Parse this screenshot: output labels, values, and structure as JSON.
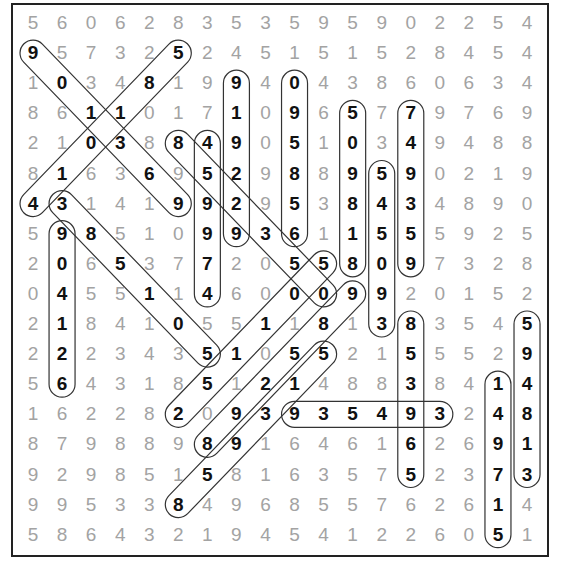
{
  "puzzle": {
    "type": "number-search",
    "rows": 18,
    "cols": 18,
    "grid": [
      [
        5,
        6,
        0,
        6,
        2,
        8,
        3,
        5,
        3,
        5,
        9,
        5,
        9,
        0,
        2,
        2,
        5,
        4
      ],
      [
        9,
        5,
        7,
        3,
        2,
        5,
        2,
        4,
        5,
        1,
        5,
        1,
        5,
        2,
        8,
        4,
        5,
        4
      ],
      [
        1,
        0,
        3,
        4,
        8,
        1,
        9,
        9,
        4,
        0,
        4,
        3,
        8,
        6,
        0,
        6,
        3,
        4
      ],
      [
        8,
        6,
        1,
        1,
        0,
        1,
        7,
        1,
        0,
        9,
        6,
        5,
        7,
        7,
        9,
        7,
        6,
        9
      ],
      [
        2,
        1,
        0,
        3,
        8,
        8,
        4,
        9,
        0,
        5,
        1,
        0,
        3,
        4,
        9,
        4,
        8,
        8
      ],
      [
        8,
        1,
        6,
        3,
        6,
        9,
        5,
        2,
        9,
        8,
        8,
        9,
        5,
        9,
        0,
        2,
        1,
        9
      ],
      [
        4,
        3,
        1,
        4,
        1,
        9,
        9,
        2,
        9,
        5,
        3,
        8,
        4,
        3,
        4,
        8,
        9,
        0
      ],
      [
        5,
        9,
        8,
        5,
        1,
        0,
        9,
        9,
        3,
        6,
        1,
        1,
        5,
        5,
        5,
        9,
        2,
        5
      ],
      [
        2,
        0,
        6,
        5,
        3,
        7,
        7,
        2,
        0,
        5,
        5,
        8,
        0,
        9,
        7,
        3,
        2,
        8
      ],
      [
        0,
        4,
        5,
        5,
        1,
        1,
        4,
        6,
        0,
        0,
        0,
        9,
        9,
        2,
        0,
        1,
        5,
        2
      ],
      [
        2,
        1,
        8,
        4,
        1,
        0,
        5,
        5,
        1,
        1,
        8,
        1,
        3,
        8,
        3,
        5,
        4,
        5
      ],
      [
        2,
        2,
        2,
        3,
        4,
        3,
        5,
        1,
        0,
        5,
        5,
        2,
        1,
        5,
        5,
        5,
        2,
        9
      ],
      [
        5,
        6,
        4,
        3,
        1,
        8,
        5,
        1,
        2,
        1,
        4,
        8,
        8,
        3,
        8,
        4,
        1,
        4
      ],
      [
        1,
        6,
        2,
        2,
        8,
        2,
        0,
        9,
        3,
        9,
        3,
        5,
        4,
        9,
        3,
        2,
        4,
        8
      ],
      [
        8,
        7,
        9,
        8,
        8,
        9,
        8,
        9,
        1,
        6,
        4,
        6,
        1,
        6,
        2,
        6,
        9,
        1
      ],
      [
        9,
        2,
        9,
        8,
        5,
        1,
        5,
        8,
        1,
        6,
        3,
        5,
        7,
        5,
        2,
        3,
        7,
        3
      ],
      [
        9,
        9,
        5,
        3,
        3,
        8,
        4,
        9,
        6,
        8,
        5,
        5,
        7,
        6,
        2,
        6,
        1,
        4
      ],
      [
        5,
        8,
        6,
        4,
        3,
        2,
        1,
        9,
        4,
        5,
        4,
        1,
        2,
        2,
        6,
        0,
        5,
        1
      ]
    ],
    "found_words": [
      {
        "word": "901369",
        "start": [
          1,
          0
        ],
        "end": [
          6,
          5
        ]
      },
      {
        "word": "410185",
        "start": [
          6,
          0
        ],
        "end": [
          1,
          5
        ]
      },
      {
        "word": "919229",
        "start": [
          2,
          7
        ],
        "end": [
          7,
          7
        ]
      },
      {
        "word": "095856",
        "start": [
          2,
          9
        ],
        "end": [
          7,
          9
        ]
      },
      {
        "word": "509818",
        "start": [
          3,
          11
        ],
        "end": [
          8,
          11
        ]
      },
      {
        "word": "749359",
        "start": [
          3,
          13
        ],
        "end": [
          8,
          13
        ]
      },
      {
        "word": "459974",
        "start": [
          4,
          6
        ],
        "end": [
          9,
          6
        ]
      },
      {
        "word": "852350",
        "start": [
          4,
          5
        ],
        "end": [
          9,
          10
        ]
      },
      {
        "word": "385105",
        "start": [
          6,
          1
        ],
        "end": [
          11,
          6
        ]
      },
      {
        "word": "904126",
        "start": [
          7,
          1
        ],
        "end": [
          12,
          1
        ]
      },
      {
        "word": "545093",
        "start": [
          5,
          12
        ],
        "end": [
          10,
          12
        ]
      },
      {
        "word": "251105",
        "start": [
          13,
          5
        ],
        "end": [
          8,
          10
        ]
      },
      {
        "word": "892589",
        "start": [
          14,
          6
        ],
        "end": [
          9,
          11
        ]
      },
      {
        "word": "859315",
        "start": [
          16,
          5
        ],
        "end": [
          11,
          10
        ]
      },
      {
        "word": "935493",
        "start": [
          13,
          9
        ],
        "end": [
          13,
          14
        ]
      },
      {
        "word": "853965",
        "start": [
          10,
          13
        ],
        "end": [
          15,
          13
        ]
      },
      {
        "word": "594813",
        "start": [
          10,
          17
        ],
        "end": [
          15,
          17
        ]
      },
      {
        "word": "149715",
        "start": [
          12,
          16
        ],
        "end": [
          17,
          16
        ]
      }
    ],
    "colors": {
      "normal_digit": "#a3a3a3",
      "found_digit": "#111111",
      "loop_stroke": "#333333",
      "border": "#222222"
    }
  }
}
